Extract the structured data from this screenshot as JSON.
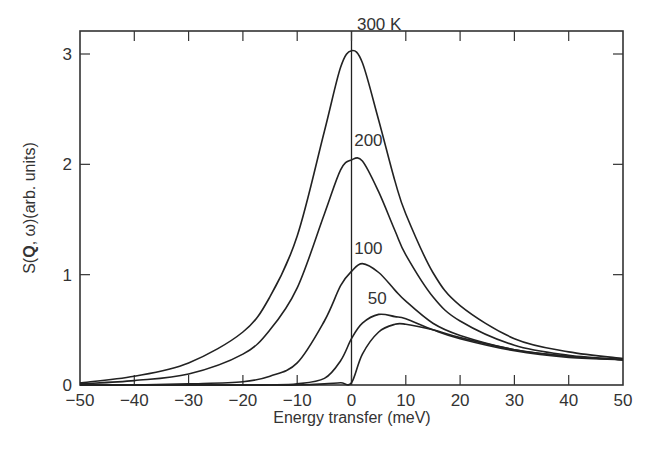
{
  "chart_data": {
    "type": "line",
    "title": "",
    "xlabel": "Energy transfer (meV)",
    "ylabel": "S(Q, ω)(arb. units)",
    "ylabel_parts": {
      "prefix": "S(",
      "bold": "Q",
      "suffix": ", ω)(arb. units)"
    },
    "xlim": [
      -50,
      50
    ],
    "ylim": [
      0,
      3.2
    ],
    "grid": false,
    "legend": "inline labels near peaks",
    "x_ticks": [
      -50,
      -40,
      -30,
      -20,
      -10,
      0,
      10,
      20,
      30,
      40,
      50
    ],
    "x_tick_labels": [
      "−50",
      "−40",
      "−30",
      "−20",
      "−10",
      "0",
      "10",
      "20",
      "30",
      "40",
      "50"
    ],
    "y_ticks": [
      0,
      1,
      2,
      3
    ],
    "y_tick_labels": [
      "0",
      "1",
      "2",
      "3"
    ],
    "vertical_line_at_x": 0,
    "x": [
      -50,
      -40,
      -30,
      -20,
      -15,
      -10,
      -5,
      -2,
      0,
      2,
      5,
      8,
      10,
      15,
      20,
      30,
      40,
      50
    ],
    "series": [
      {
        "name": "300 K",
        "label": "300 K",
        "values": [
          0.02,
          0.08,
          0.2,
          0.48,
          0.8,
          1.35,
          2.3,
          2.88,
          3.03,
          2.92,
          2.4,
          1.85,
          1.55,
          1.02,
          0.72,
          0.42,
          0.3,
          0.24
        ]
      },
      {
        "name": "200 K",
        "label": "200",
        "values": [
          0.01,
          0.04,
          0.1,
          0.28,
          0.5,
          0.88,
          1.55,
          1.95,
          2.04,
          2.03,
          1.75,
          1.4,
          1.18,
          0.8,
          0.58,
          0.36,
          0.27,
          0.23
        ]
      },
      {
        "name": "100 K",
        "label": "100",
        "values": [
          0.0,
          0.0,
          0.01,
          0.03,
          0.08,
          0.2,
          0.58,
          0.9,
          1.03,
          1.1,
          1.02,
          0.86,
          0.76,
          0.56,
          0.45,
          0.32,
          0.26,
          0.23
        ]
      },
      {
        "name": "50 K",
        "label": "50",
        "values": [
          0.0,
          0.0,
          0.0,
          0.0,
          0.0,
          0.01,
          0.06,
          0.22,
          0.42,
          0.56,
          0.64,
          0.62,
          0.6,
          0.5,
          0.42,
          0.31,
          0.25,
          0.23
        ]
      },
      {
        "name": "lowest T (unlabeled)",
        "label": "",
        "values": [
          0.0,
          0.0,
          0.0,
          0.0,
          0.0,
          0.0,
          0.01,
          0.02,
          0.02,
          0.28,
          0.48,
          0.55,
          0.55,
          0.5,
          0.43,
          0.32,
          0.26,
          0.23
        ]
      }
    ],
    "label_positions": [
      {
        "text": "300 K",
        "x": 1,
        "y": 3.2
      },
      {
        "text": "200",
        "x": 0.5,
        "y": 2.15
      },
      {
        "text": "100",
        "x": 0.5,
        "y": 1.17
      },
      {
        "text": "50",
        "x": 3.0,
        "y": 0.72
      }
    ]
  },
  "style": {
    "line_color": "#222222",
    "axis_color": "#333333",
    "background": "#ffffff"
  }
}
